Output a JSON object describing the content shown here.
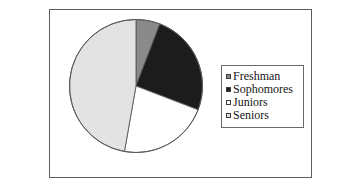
{
  "frame": {
    "border_color": "#5d5d5d"
  },
  "legend": {
    "title": "",
    "border_color": "#6a6a6a",
    "items": [
      {
        "label": "Freshman",
        "swatch_name": "legend-swatch-freshman",
        "color": "#8a8a8a"
      },
      {
        "label": "Sophomores",
        "swatch_name": "legend-swatch-sophomores",
        "color": "#1c1c1c"
      },
      {
        "label": "Juniors",
        "swatch_name": "legend-swatch-juniors",
        "color": "#ffffff"
      },
      {
        "label": "Seniors",
        "swatch_name": "legend-swatch-seniors",
        "color": "#e3e3e3"
      }
    ]
  },
  "chart_data": {
    "type": "pie",
    "title": "",
    "xlabel": "",
    "ylabel": "",
    "legend_position": "right",
    "grid": false,
    "start_angle_deg": 0,
    "direction": "clockwise",
    "outline_color": "#5a5a5a",
    "categories": [
      "Freshman",
      "Sophomores",
      "Juniors",
      "Seniors"
    ],
    "values": [
      5.8,
      25.0,
      22.0,
      47.2
    ],
    "value_unit": "percent",
    "colors": [
      "#8a8a8a",
      "#1c1c1c",
      "#ffffff",
      "#e3e3e3"
    ],
    "slices": [
      {
        "label": "Freshman",
        "value": 5.8,
        "angle_deg": 21,
        "start_deg": 0,
        "end_deg": 21,
        "color": "#8a8a8a"
      },
      {
        "label": "Sophomores",
        "value": 25.0,
        "angle_deg": 90,
        "start_deg": 21,
        "end_deg": 111,
        "color": "#1c1c1c"
      },
      {
        "label": "Juniors",
        "value": 22.0,
        "angle_deg": 79,
        "start_deg": 111,
        "end_deg": 190,
        "color": "#ffffff"
      },
      {
        "label": "Seniors",
        "value": 47.2,
        "angle_deg": 170,
        "start_deg": 190,
        "end_deg": 360,
        "color": "#e3e3e3"
      }
    ]
  }
}
